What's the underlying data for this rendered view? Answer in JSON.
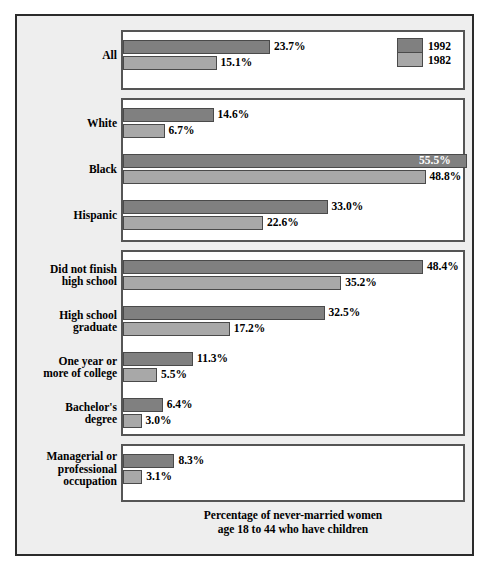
{
  "caption": {
    "line1": "Percentage of never-married women",
    "line2": "age 18 to 44 who have children"
  },
  "legend": {
    "items": [
      {
        "label": "1992",
        "color": "#808080"
      },
      {
        "label": "1982",
        "color": "#a8a8a8"
      }
    ]
  },
  "chart_data": {
    "type": "bar",
    "orientation": "horizontal",
    "title": "",
    "subtitle": "",
    "xlabel": "Percentage of never-married women age 18 to 44 who have children",
    "ylabel": "",
    "xlim": [
      0,
      56
    ],
    "grid": false,
    "legend_position": "top-right",
    "value_suffix": "%",
    "categories": [
      "All",
      "White",
      "Black",
      "Hispanic",
      "Did not finish high school",
      "High school graduate",
      "One year or more of college",
      "Bachelor's degree",
      "Managerial or professional occupation"
    ],
    "series": [
      {
        "name": "1992",
        "color": "#808080",
        "values": [
          23.7,
          14.6,
          55.5,
          33.0,
          48.4,
          32.5,
          11.3,
          6.4,
          8.3
        ]
      },
      {
        "name": "1982",
        "color": "#a8a8a8",
        "values": [
          15.1,
          6.7,
          48.8,
          22.6,
          35.2,
          17.2,
          5.5,
          3.0,
          3.1
        ]
      }
    ],
    "panels": [
      {
        "name": "all",
        "rows": [
          {
            "label_line1": "All",
            "label_line2": "",
            "v1992": 23.7,
            "v1982": 15.1,
            "t1992": "23.7%",
            "t1982": "15.1%",
            "inside1992": false
          }
        ]
      },
      {
        "name": "race",
        "rows": [
          {
            "label_line1": "White",
            "label_line2": "",
            "v1992": 14.6,
            "v1982": 6.7,
            "t1992": "14.6%",
            "t1982": "6.7%",
            "inside1992": false
          },
          {
            "label_line1": "Black",
            "label_line2": "",
            "v1992": 55.5,
            "v1982": 48.8,
            "t1992": "55.5%",
            "t1982": "48.8%",
            "inside1992": true
          },
          {
            "label_line1": "Hispanic",
            "label_line2": "",
            "v1992": 33.0,
            "v1982": 22.6,
            "t1992": "33.0%",
            "t1982": "22.6%",
            "inside1992": false
          }
        ]
      },
      {
        "name": "education",
        "rows": [
          {
            "label_line1": "Did not finish",
            "label_line2": "high school",
            "v1992": 48.4,
            "v1982": 35.2,
            "t1992": "48.4%",
            "t1982": "35.2%",
            "inside1992": false
          },
          {
            "label_line1": "High school",
            "label_line2": "graduate",
            "v1992": 32.5,
            "v1982": 17.2,
            "t1992": "32.5%",
            "t1982": "17.2%",
            "inside1992": false
          },
          {
            "label_line1": "One year or",
            "label_line2": "more of college",
            "v1992": 11.3,
            "v1982": 5.5,
            "t1992": "11.3%",
            "t1982": "5.5%",
            "inside1992": false
          },
          {
            "label_line1": "Bachelor's",
            "label_line2": "degree",
            "v1992": 6.4,
            "v1982": 3.0,
            "t1992": "6.4%",
            "t1982": "3.0%",
            "inside1992": false
          }
        ]
      },
      {
        "name": "occupation",
        "rows": [
          {
            "label_line1": "Managerial or",
            "label_line2": "professional",
            "label_line3": "occupation",
            "v1992": 8.3,
            "v1982": 3.1,
            "t1992": "8.3%",
            "t1982": "3.1%",
            "inside1992": false
          }
        ]
      }
    ]
  }
}
